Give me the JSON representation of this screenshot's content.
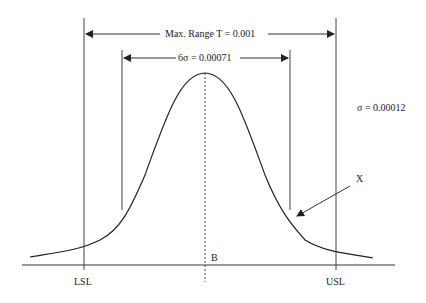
{
  "diagram": {
    "type": "normal-distribution-tolerance",
    "labels": {
      "max_range": "Max. Range T = 0.001",
      "six_sigma": "6σ = 0.00071",
      "sigma": "σ = 0.00012",
      "x_marker": "X",
      "lsl": "LSL",
      "usl": "USL",
      "mean": "B"
    },
    "colors": {
      "line": "#222222",
      "background": "#ffffff"
    }
  }
}
